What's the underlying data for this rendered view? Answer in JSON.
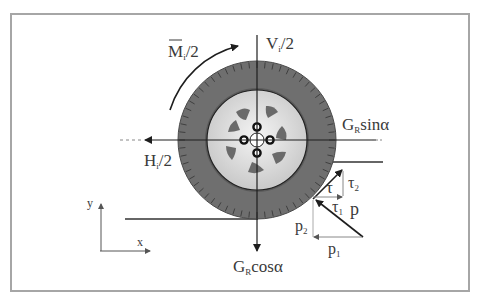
{
  "diagram": {
    "type": "free-body-diagram",
    "labels": {
      "moment": {
        "main": "M",
        "sub": "i",
        "suffix": "/2"
      },
      "vertical_force": {
        "main": "V",
        "sub": "i",
        "suffix": "/2"
      },
      "horizontal_force": {
        "main": "H",
        "sub": "i",
        "suffix": "/2"
      },
      "gravity_sin": {
        "main": "G",
        "sub": "R",
        "suffix": "sinα"
      },
      "gravity_cos": {
        "main": "G",
        "sub": "R",
        "suffix": "cosα"
      },
      "tau": "τ",
      "tau1": {
        "main": "τ",
        "sub": "1"
      },
      "tau2": {
        "main": "τ",
        "sub": "2"
      },
      "p": "p",
      "p1": {
        "main": "p",
        "sub": "1"
      },
      "p2": {
        "main": "p",
        "sub": "2"
      },
      "axis_x": "x",
      "axis_y": "y"
    },
    "colors": {
      "frame": "#a6a6a6",
      "tire": "#6b6b6b",
      "rim": "#dcdcdc",
      "lines": "#1e1e1e",
      "text": "#3a3a3a"
    }
  }
}
